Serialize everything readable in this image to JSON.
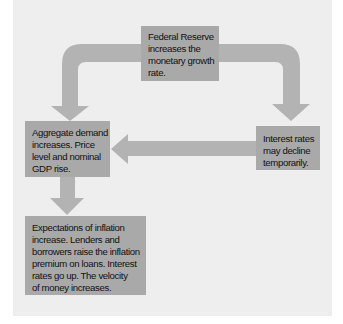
{
  "diagram": {
    "type": "flow-cycle",
    "colors": {
      "panel_background": "#eeeeee",
      "box_fill": "#a9a9a9",
      "arrow_fill": "#b3b3b3",
      "text": "#111111"
    },
    "nodes": {
      "fed": {
        "lines": [
          "Federal Reserve",
          "increases the",
          "monetary growth",
          "rate."
        ]
      },
      "aggregate": {
        "lines": [
          "Aggregate demand",
          "increases. Price",
          "level and nominal",
          "GDP rise."
        ]
      },
      "interest": {
        "lines": [
          "Interest rates",
          "may decline",
          "temporarily."
        ]
      },
      "expectations": {
        "lines": [
          "Expectations of inflation",
          "increase. Lenders and",
          "borrowers raise the inflation",
          "premium on loans. Interest",
          "rates go up. The velocity",
          "of money increases."
        ]
      }
    },
    "edges": [
      {
        "from": "fed",
        "to": "aggregate"
      },
      {
        "from": "fed",
        "to": "interest"
      },
      {
        "from": "interest",
        "to": "aggregate"
      },
      {
        "from": "aggregate",
        "to": "expectations"
      }
    ]
  }
}
